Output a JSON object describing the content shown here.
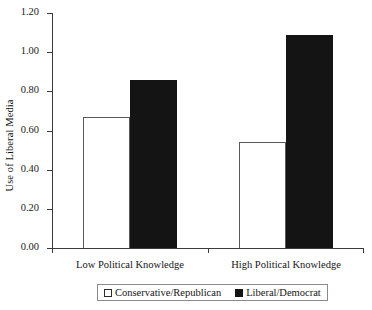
{
  "chart_data": {
    "type": "bar",
    "title": "",
    "xlabel": "",
    "ylabel": "Use of Liberal Media",
    "categories": [
      "Low Political Knowledge",
      "High Political Knowledge"
    ],
    "series": [
      {
        "name": "Conservative/Republican",
        "values": [
          0.67,
          0.54
        ],
        "style": "open",
        "color": "#ffffff"
      },
      {
        "name": "Liberal/Democrat",
        "values": [
          0.86,
          1.09
        ],
        "style": "filled",
        "color": "#141414"
      }
    ],
    "ylim": [
      0.0,
      1.2
    ],
    "ytick_values": [
      1.2,
      1.0,
      0.8,
      0.6,
      0.4,
      0.2,
      0.0
    ],
    "ytick_labels": [
      "1.20",
      "1.00",
      "0.80",
      "0.60",
      "0.40",
      "0.20",
      "0.00"
    ],
    "grid": false,
    "legend_position": "bottom-center"
  },
  "legend": {
    "entries": [
      {
        "label": "Conservative/Republican"
      },
      {
        "label": "Liberal/Democrat"
      }
    ]
  }
}
